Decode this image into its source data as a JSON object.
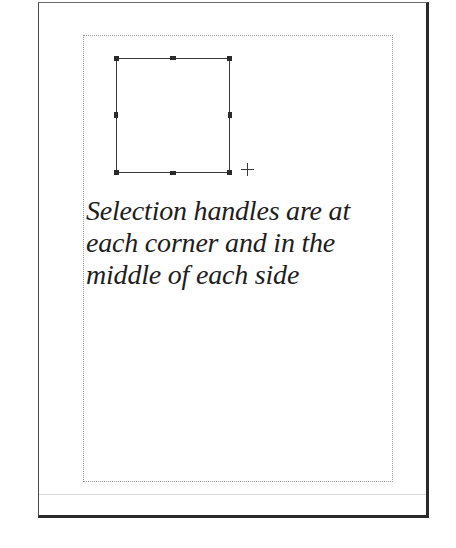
{
  "document": {
    "caption_lines": [
      "Selection handles are at",
      "each corner and in the",
      "middle of each side"
    ]
  },
  "selection": {
    "handles": [
      "top-left",
      "top-middle",
      "top-right",
      "middle-left",
      "middle-right",
      "bottom-left",
      "bottom-middle",
      "bottom-right"
    ]
  },
  "cursor": {
    "icon": "crosshair-cursor-icon"
  }
}
